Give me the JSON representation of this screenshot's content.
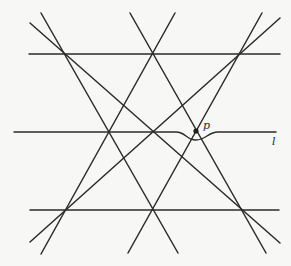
{
  "diagram": {
    "type": "line-arrangement",
    "background": "#f7f7f5",
    "stroke_color": "#2b2b2b",
    "horizontal_lines": [
      {
        "name": "top-horizontal",
        "x1": 29,
        "y1": 54,
        "x2": 280,
        "y2": 54
      },
      {
        "name": "bottom-horizontal",
        "x1": 30,
        "y1": 210,
        "x2": 279,
        "y2": 210
      }
    ],
    "slanted_lines": [
      {
        "name": "line-a",
        "x1": 41,
        "y1": 13,
        "x2": 178,
        "y2": 253
      },
      {
        "name": "line-b",
        "x1": 30,
        "y1": 23,
        "x2": 280,
        "y2": 243
      },
      {
        "name": "line-c",
        "x1": 130,
        "y1": 13,
        "x2": 266,
        "y2": 253
      },
      {
        "name": "line-d",
        "x1": 175,
        "y1": 13,
        "x2": 41,
        "y2": 254
      },
      {
        "name": "line-e",
        "x1": 262,
        "y1": 13,
        "x2": 128,
        "y2": 253
      },
      {
        "name": "line-f",
        "x1": 280,
        "y1": 18,
        "x2": 30,
        "y2": 242
      }
    ],
    "perturbed_line": {
      "name": "line-l",
      "path": "M14 132 L176 132 C186 132, 186 140, 196 140 C206 140, 208 132, 218 132 L276 132"
    },
    "point_p": {
      "x": 196,
      "y": 131,
      "r": 2.6
    },
    "labels": {
      "p": {
        "text": "p",
        "x": 203,
        "y": 129
      },
      "l": {
        "text": "l",
        "x": 272,
        "y": 145
      }
    }
  }
}
